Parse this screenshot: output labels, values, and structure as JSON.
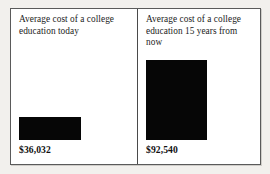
{
  "figure": {
    "panels": [
      {
        "caption": "Average cost of a college education today",
        "value_label": "$36,032"
      },
      {
        "caption": "Average cost of a college education 15 years from now",
        "value_label": "$92,540"
      }
    ]
  },
  "chart_data": {
    "type": "bar",
    "title": "",
    "xlabel": "",
    "ylabel": "",
    "categories": [
      "Average cost of a college education today",
      "Average cost of a college education 15 years from now"
    ],
    "values": [
      36032,
      92540
    ],
    "value_labels": [
      "$36,032",
      "$92,540"
    ],
    "bar_color": "#060606",
    "legend": "none",
    "grid": false,
    "ylim": [
      0,
      92540
    ]
  }
}
